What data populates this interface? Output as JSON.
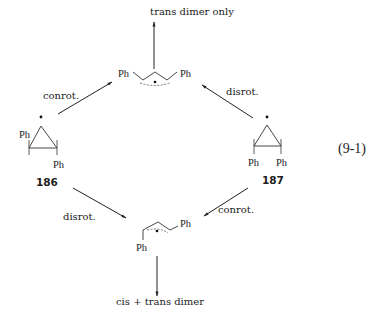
{
  "equation_number": "(9-1)",
  "top_product": {
    "label": "trans dimer only"
  },
  "bottom_product": {
    "label": "cis + trans dimer"
  },
  "compounds": [
    {
      "id": "186",
      "label": "186",
      "substituents": [
        "Ph",
        "Ph"
      ],
      "radical": "•"
    },
    {
      "id": "187",
      "label": "187",
      "substituents": [
        "Ph",
        "Ph"
      ],
      "radical": "•"
    }
  ],
  "allyl_radicals": {
    "top": {
      "substituents": [
        "Ph",
        "Ph"
      ],
      "radical": "•"
    },
    "bottom": {
      "substituents": [
        "Ph",
        "Ph"
      ],
      "radical": "•"
    }
  },
  "arrows": {
    "186_to_top": {
      "label": "conrot."
    },
    "187_to_top": {
      "label": "disrot."
    },
    "186_to_bottom": {
      "label": "disrot."
    },
    "187_to_bottom": {
      "label": "conrot."
    }
  }
}
